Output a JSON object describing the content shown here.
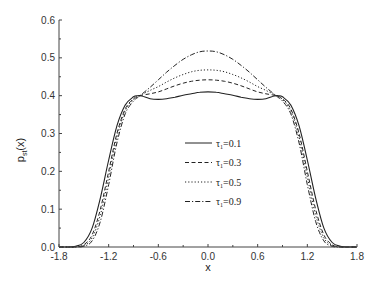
{
  "chart_data": {
    "type": "line",
    "title": "",
    "xlabel": "x",
    "ylabel": "p_st(x)",
    "xlim": [
      -1.8,
      1.8
    ],
    "ylim": [
      0.0,
      0.6
    ],
    "xticks": [
      -1.8,
      -1.2,
      -0.6,
      0.0,
      0.6,
      1.2,
      1.8
    ],
    "xtick_labels": [
      "-1.8",
      "-1.2",
      "-0.6",
      "0.0",
      "0.6",
      "1.2",
      "1.8"
    ],
    "yticks": [
      0.0,
      0.1,
      0.2,
      0.3,
      0.4,
      0.5,
      0.6
    ],
    "ytick_labels": [
      "0.0",
      "0.1",
      "0.2",
      "0.3",
      "0.4",
      "0.5",
      "0.6"
    ],
    "grid": false,
    "legend_position": "center-right inside",
    "x": [
      -1.8,
      -1.7,
      -1.6,
      -1.5,
      -1.4,
      -1.3,
      -1.2,
      -1.1,
      -1.0,
      -0.9,
      -0.85,
      -0.8,
      -0.7,
      -0.6,
      -0.5,
      -0.4,
      -0.3,
      -0.2,
      -0.1,
      0.0,
      0.1,
      0.2,
      0.3,
      0.4,
      0.5,
      0.6,
      0.7,
      0.8,
      0.85,
      0.9,
      1.0,
      1.1,
      1.2,
      1.3,
      1.4,
      1.5,
      1.6,
      1.7,
      1.8
    ],
    "series": [
      {
        "name": "τ1=0.1",
        "style": "solid",
        "values": [
          0.0,
          0.0,
          0.002,
          0.012,
          0.05,
          0.13,
          0.23,
          0.32,
          0.375,
          0.397,
          0.4,
          0.399,
          0.392,
          0.39,
          0.392,
          0.396,
          0.401,
          0.405,
          0.409,
          0.41,
          0.409,
          0.405,
          0.401,
          0.396,
          0.392,
          0.39,
          0.392,
          0.399,
          0.4,
          0.397,
          0.375,
          0.32,
          0.23,
          0.13,
          0.05,
          0.012,
          0.002,
          0.0,
          0.0
        ]
      },
      {
        "name": "τ1=0.3",
        "style": "dashed",
        "values": [
          0.0,
          0.0,
          0.0,
          0.006,
          0.032,
          0.1,
          0.2,
          0.3,
          0.365,
          0.392,
          0.398,
          0.401,
          0.405,
          0.41,
          0.418,
          0.426,
          0.433,
          0.438,
          0.441,
          0.442,
          0.441,
          0.438,
          0.433,
          0.426,
          0.418,
          0.41,
          0.405,
          0.401,
          0.398,
          0.392,
          0.365,
          0.3,
          0.2,
          0.1,
          0.032,
          0.006,
          0.0,
          0.0,
          0.0
        ]
      },
      {
        "name": "τ1=0.5",
        "style": "dotted",
        "values": [
          0.0,
          0.0,
          0.0,
          0.004,
          0.024,
          0.085,
          0.185,
          0.29,
          0.36,
          0.39,
          0.397,
          0.403,
          0.414,
          0.424,
          0.436,
          0.447,
          0.456,
          0.463,
          0.467,
          0.468,
          0.467,
          0.463,
          0.456,
          0.447,
          0.436,
          0.424,
          0.414,
          0.403,
          0.397,
          0.39,
          0.36,
          0.29,
          0.185,
          0.085,
          0.024,
          0.004,
          0.0,
          0.0,
          0.0
        ]
      },
      {
        "name": "τ1=0.9",
        "style": "dash-dot",
        "values": [
          0.0,
          0.0,
          0.0,
          0.002,
          0.016,
          0.068,
          0.165,
          0.275,
          0.352,
          0.386,
          0.395,
          0.404,
          0.422,
          0.442,
          0.462,
          0.48,
          0.496,
          0.508,
          0.516,
          0.518,
          0.516,
          0.508,
          0.496,
          0.48,
          0.462,
          0.442,
          0.422,
          0.404,
          0.395,
          0.386,
          0.352,
          0.275,
          0.165,
          0.068,
          0.016,
          0.002,
          0.0,
          0.0,
          0.0
        ]
      }
    ]
  },
  "legend": {
    "items": [
      {
        "label": "τ1=0.1",
        "sub": "1",
        "value": "=0.1"
      },
      {
        "label": "τ1=0.3",
        "sub": "1",
        "value": "=0.3"
      },
      {
        "label": "τ1=0.5",
        "sub": "1",
        "value": "=0.5"
      },
      {
        "label": "τ1=0.9",
        "sub": "1",
        "value": "=0.9"
      }
    ]
  },
  "axes": {
    "xlabel": "x",
    "ylabel_main": "p",
    "ylabel_sub": "st",
    "ylabel_tail": "(x)"
  }
}
